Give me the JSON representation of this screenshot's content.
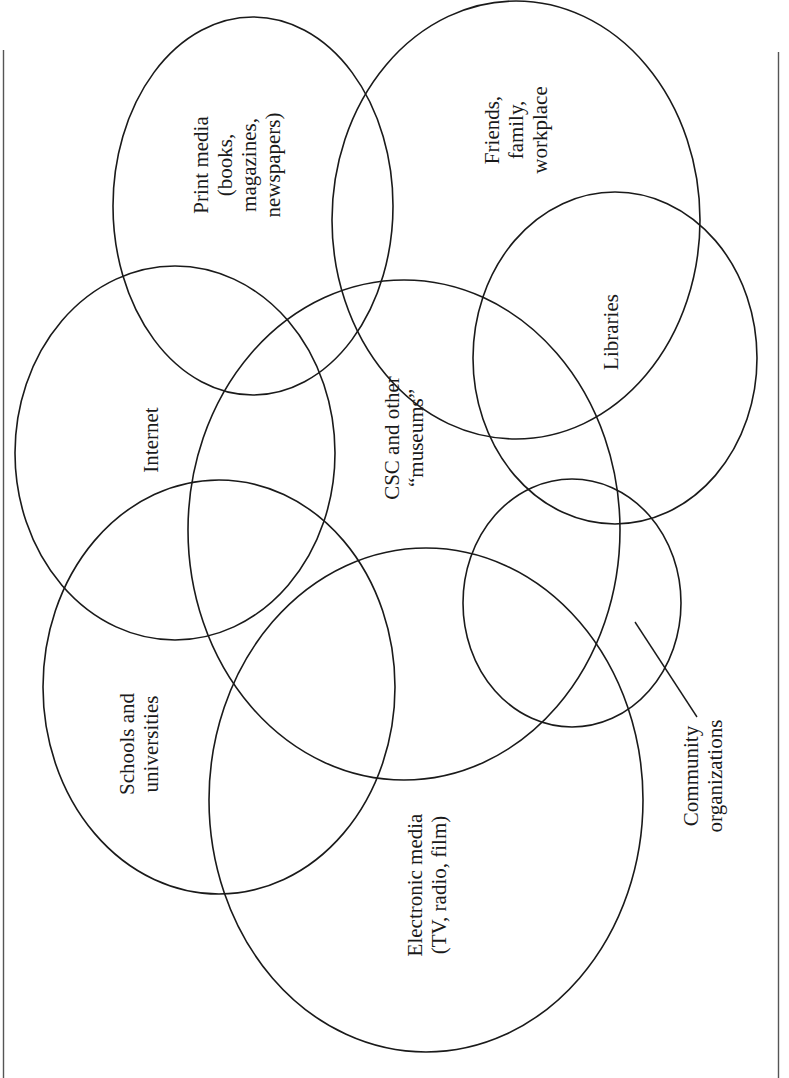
{
  "diagram": {
    "type": "overlapping-ellipses",
    "orientation": "rotated-90-ccw",
    "stroke_color": "#1a1a1a",
    "background": "#ffffff",
    "sets": [
      {
        "id": "print-media",
        "lines": [
          "Print media",
          "(books,",
          "magazines,",
          "newspapers)"
        ],
        "cx": 253,
        "cy": 206,
        "rx": 140,
        "ry": 189
      },
      {
        "id": "friends-family-workplace",
        "lines": [
          "Friends,",
          "family,",
          "workplace"
        ],
        "cx": 516,
        "cy": 218,
        "rx": 184,
        "ry": 220
      },
      {
        "id": "libraries",
        "lines": [
          "Libraries"
        ],
        "cx": 615,
        "cy": 358,
        "rx": 142,
        "ry": 166
      },
      {
        "id": "internet",
        "lines": [
          "Internet"
        ],
        "cx": 175,
        "cy": 453,
        "rx": 160,
        "ry": 187
      },
      {
        "id": "csc-museums",
        "lines": [
          "CSC and other",
          "“museums”"
        ],
        "cx": 404,
        "cy": 530,
        "rx": 216,
        "ry": 250
      },
      {
        "id": "community-organizations",
        "lines": [
          "Community",
          "organizations"
        ],
        "cx": 572,
        "cy": 603,
        "rx": 109,
        "ry": 124
      },
      {
        "id": "schools-universities",
        "lines": [
          "Schools and",
          "universities"
        ],
        "cx": 219,
        "cy": 687,
        "rx": 176,
        "ry": 207
      },
      {
        "id": "electronic-media",
        "lines": [
          "Electronic media",
          "(TV, radio, film)"
        ],
        "cx": 426,
        "cy": 800,
        "rx": 217,
        "ry": 252
      }
    ],
    "labels": {
      "print_media": {
        "l1": "Print media",
        "l2": "(books,",
        "l3": "magazines,",
        "l4": "newspapers)"
      },
      "friends": {
        "l1": "Friends,",
        "l2": "family,",
        "l3": "workplace"
      },
      "libraries": {
        "l1": "Libraries"
      },
      "internet": {
        "l1": "Internet"
      },
      "csc": {
        "l1": "CSC and other",
        "l2": "“museums”"
      },
      "community": {
        "l1": "Community",
        "l2": "organizations"
      },
      "schools": {
        "l1": "Schools and",
        "l2": "universities"
      },
      "electronic": {
        "l1": "Electronic media",
        "l2": "(TV, radio, film)"
      }
    },
    "leader_line": {
      "from": [
        635,
        622
      ],
      "to": [
        697,
        717
      ],
      "points_to": "community-organizations"
    },
    "frame": {
      "left_x": 3,
      "right_x": 778,
      "top_y": 50,
      "bottom_y": 1078
    }
  }
}
